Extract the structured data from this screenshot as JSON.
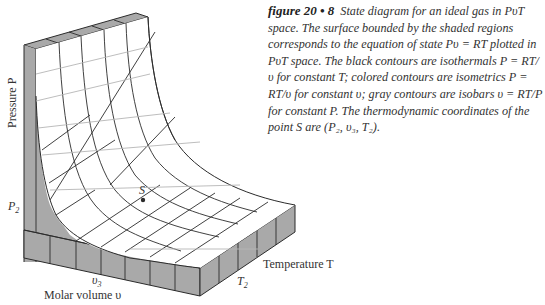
{
  "caption": {
    "figure_number": "figure 20 • 8",
    "text": "State diagram for an ideal gas in PυT space. The surface bounded by the shaded regions corresponds to the equation of state Pυ = RT plotted in PυT space. The black contours are isothermals P = RT/υ for constant T; colored contours are isometrics P = RT/υ for constant υ; gray contours are isobars υ = RT/P for constant P. The thermodynamic coordinates of the point S are (P₂, υ₃, T₂)."
  },
  "axes": {
    "pressure_label": "Pressure P",
    "volume_label": "Molar volume υ",
    "temperature_label": "Temperature T",
    "p2_label": "P",
    "p2_sub": "2",
    "v3_label": "υ",
    "v3_sub": "3",
    "t2_label": "T",
    "t2_sub": "2",
    "point_label": "S"
  },
  "colors": {
    "shade": "#a9a9a9",
    "line": "#2b2b2b",
    "gray_contour": "#b5b5b5",
    "surface": "#ffffff"
  }
}
